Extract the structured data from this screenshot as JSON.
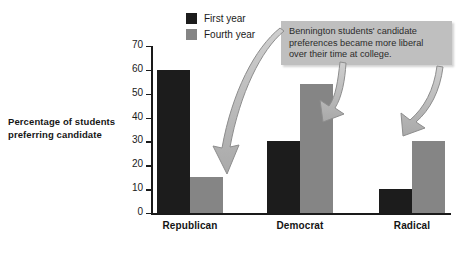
{
  "chart_data": {
    "type": "bar",
    "title": "",
    "subtitle": "",
    "xlabel": "",
    "ylabel": "Percentage of students preferring candidate",
    "ylim": [
      0,
      70
    ],
    "ytick_labels": [
      "0",
      "10",
      "20",
      "30",
      "40",
      "50",
      "60",
      "70"
    ],
    "yticks": [
      0,
      10,
      20,
      30,
      40,
      50,
      60,
      70
    ],
    "grid": false,
    "legend_position": "top-center",
    "categories": [
      "Republican",
      "Democrat",
      "Radical"
    ],
    "series": [
      {
        "name": "First year",
        "color": "#1c1c1c",
        "values": [
          60,
          30,
          10
        ]
      },
      {
        "name": "Fourth year",
        "color": "#858585",
        "values": [
          15,
          54,
          30
        ]
      }
    ],
    "annotations": [
      {
        "id": "callout",
        "text": "Bennington students' candidate preferences became more liberal over their time at college.",
        "lines": [
          "Bennington students' candidate",
          "preferences became more liberal",
          "over their time at college."
        ],
        "points_to": [
          "Republican fourth year bar",
          "Democrat fourth year bar",
          "Radical fourth year bar"
        ]
      }
    ]
  },
  "axis": {
    "y_label_lines": [
      "Percentage of students",
      "preferring candidate"
    ]
  },
  "legend": {
    "items": [
      {
        "label": "First year"
      },
      {
        "label": "Fourth year"
      }
    ]
  }
}
